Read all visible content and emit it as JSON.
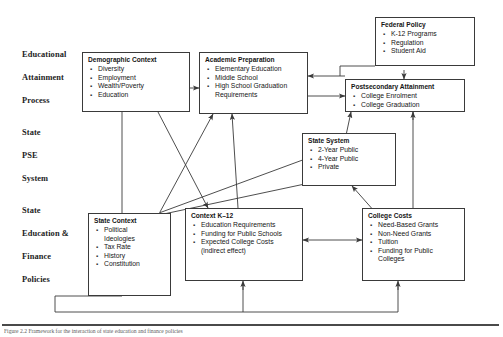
{
  "figure": {
    "caption": "Figure 2.2  Framework for the interaction of state education and finance policies",
    "row_labels": [
      {
        "id": "educational",
        "lines": [
          "Educational",
          "Attainment",
          "Process"
        ]
      },
      {
        "id": "state-pse-system",
        "lines": [
          "State",
          "PSE",
          "System"
        ]
      },
      {
        "id": "state-education-finance-policies",
        "lines": [
          "State",
          "Education &",
          "Finance",
          "Policies"
        ]
      }
    ],
    "boxes": [
      {
        "id": "demographic-context",
        "title": "Demographic Context",
        "items": [
          "Diversity",
          "Employment",
          "Wealth/Poverty",
          "Education"
        ]
      },
      {
        "id": "academic-preparation",
        "title": "Academic Preparation",
        "items": [
          "Elementary Education",
          "Middle School",
          "High School Graduation"
        ],
        "continuation": "Requirements"
      },
      {
        "id": "federal-policy",
        "title": "Federal Policy",
        "items": [
          "K-12 Programs",
          "Regulation",
          "Student Aid"
        ]
      },
      {
        "id": "postsecondary-attainment",
        "title": "Postsecondary Attainment",
        "items": [
          "College Enrolment",
          "College Graduation"
        ]
      },
      {
        "id": "state-system",
        "title": "State System",
        "items": [
          "2-Year Public",
          "4-Year Public",
          "Private"
        ]
      },
      {
        "id": "state-context",
        "title": "State Context",
        "items": [
          "Political",
          "Tax Rate",
          "History",
          "Constitution"
        ],
        "first_item_second_line": "Ideologies"
      },
      {
        "id": "context-k12",
        "title": "Context K–12",
        "items": [
          "Education Requirements",
          "Funding for Public Schools",
          "Expected College Costs"
        ],
        "continuation": "(indirect effect)"
      },
      {
        "id": "college-costs",
        "title": "College Costs",
        "items": [
          "Need-Based Grants",
          "Non-Need Grants",
          "Tuition",
          "Funding for Public"
        ],
        "continuation": "Colleges"
      }
    ],
    "colors": {
      "box_border": "#3a3a3a",
      "arrow": "#3a3a3a",
      "text": "#161616",
      "label_text": "#232323",
      "background": "#ffffff"
    }
  }
}
